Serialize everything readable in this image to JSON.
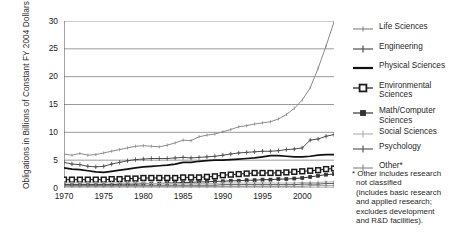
{
  "chart_data": {
    "type": "line",
    "title": "",
    "xlabel": "",
    "ylabel": "Obligations in Billions of Constant FY 2004 Dollars",
    "xlim": [
      1970,
      2004
    ],
    "ylim": [
      0,
      30
    ],
    "yticks": [
      0,
      5,
      10,
      15,
      20,
      25,
      30
    ],
    "xticks": [
      1970,
      1975,
      1980,
      1985,
      1990,
      1995,
      2000
    ],
    "xtick_labels": [
      "1970",
      "1975",
      "1980",
      "1985",
      "1990",
      "1995",
      "2000"
    ],
    "grid": "horizontal",
    "legend_position": "right",
    "x": [
      1970,
      1971,
      1972,
      1973,
      1974,
      1975,
      1976,
      1977,
      1978,
      1979,
      1980,
      1981,
      1982,
      1983,
      1984,
      1985,
      1986,
      1987,
      1988,
      1989,
      1990,
      1991,
      1992,
      1993,
      1994,
      1995,
      1996,
      1997,
      1998,
      1999,
      2000,
      2001,
      2002,
      2003,
      2004
    ],
    "series": [
      {
        "name": "Life Sciences",
        "color": "#8a8a8a",
        "marker": "tick",
        "values": [
          6.1,
          5.9,
          6.2,
          5.9,
          6.0,
          6.3,
          6.6,
          6.9,
          7.2,
          7.5,
          7.6,
          7.5,
          7.4,
          7.7,
          8.1,
          8.6,
          8.5,
          9.2,
          9.5,
          9.7,
          10.1,
          10.5,
          11.0,
          11.2,
          11.5,
          11.7,
          11.9,
          12.4,
          13.2,
          14.3,
          15.8,
          18.0,
          21.5,
          25.5,
          29.8
        ]
      },
      {
        "name": "Engineering",
        "color": "#4d4d4d",
        "marker": "plus",
        "values": [
          4.6,
          4.3,
          4.2,
          3.9,
          3.8,
          3.9,
          4.3,
          4.6,
          4.9,
          5.1,
          5.2,
          5.3,
          5.3,
          5.3,
          5.4,
          5.5,
          5.4,
          5.5,
          5.6,
          5.7,
          5.9,
          6.1,
          6.3,
          6.4,
          6.5,
          6.6,
          6.6,
          6.7,
          6.9,
          7.0,
          7.2,
          8.6,
          8.8,
          9.3,
          9.6
        ]
      },
      {
        "name": "Physical Sciences",
        "color": "#111111",
        "marker": "none",
        "values": [
          3.6,
          3.4,
          3.3,
          3.1,
          2.9,
          2.8,
          3.0,
          3.2,
          3.4,
          3.6,
          3.8,
          3.9,
          4.0,
          4.1,
          4.3,
          4.6,
          4.6,
          4.8,
          4.9,
          5.0,
          5.0,
          5.1,
          5.2,
          5.3,
          5.4,
          5.6,
          5.8,
          5.8,
          5.7,
          5.6,
          5.6,
          5.7,
          5.9,
          6.0,
          6.0
        ]
      },
      {
        "name": "Environmental Sciences",
        "color": "#1a1a1a",
        "marker": "square-large",
        "values": [
          1.5,
          1.5,
          1.5,
          1.5,
          1.5,
          1.5,
          1.6,
          1.6,
          1.7,
          1.7,
          1.8,
          1.8,
          1.8,
          1.8,
          1.8,
          1.9,
          1.9,
          1.9,
          2.0,
          2.1,
          2.3,
          2.4,
          2.5,
          2.6,
          2.7,
          2.7,
          2.7,
          2.7,
          2.8,
          2.9,
          3.0,
          3.1,
          3.2,
          3.4,
          3.5
        ]
      },
      {
        "name": "Math/Computer Sciences",
        "color": "#333333",
        "marker": "square-small",
        "values": [
          0.6,
          0.6,
          0.6,
          0.6,
          0.6,
          0.6,
          0.6,
          0.7,
          0.7,
          0.7,
          0.8,
          0.8,
          0.8,
          0.9,
          0.9,
          1.0,
          1.0,
          1.1,
          1.1,
          1.2,
          1.2,
          1.3,
          1.3,
          1.4,
          1.4,
          1.5,
          1.5,
          1.6,
          1.6,
          1.7,
          1.8,
          2.0,
          2.2,
          2.4,
          2.5
        ]
      },
      {
        "name": "Social Sciences",
        "color": "#b5b5b5",
        "marker": "plus",
        "values": [
          0.9,
          0.9,
          0.9,
          0.9,
          0.9,
          0.9,
          0.9,
          0.9,
          0.9,
          0.9,
          0.9,
          0.8,
          0.8,
          0.8,
          0.8,
          0.8,
          0.8,
          0.8,
          0.8,
          0.8,
          0.9,
          0.9,
          0.9,
          0.9,
          0.9,
          0.9,
          0.9,
          0.9,
          0.9,
          0.9,
          1.0,
          1.0,
          1.0,
          1.1,
          1.1
        ]
      },
      {
        "name": "Psychology",
        "color": "#5a5a5a",
        "marker": "plus",
        "values": [
          0.5,
          0.5,
          0.5,
          0.5,
          0.5,
          0.5,
          0.5,
          0.5,
          0.5,
          0.5,
          0.5,
          0.5,
          0.5,
          0.5,
          0.5,
          0.5,
          0.5,
          0.5,
          0.5,
          0.5,
          0.6,
          0.6,
          0.6,
          0.6,
          0.6,
          0.6,
          0.6,
          0.6,
          0.6,
          0.6,
          0.7,
          0.7,
          0.7,
          0.8,
          0.8
        ]
      },
      {
        "name": "Other*",
        "color": "#909090",
        "marker": "plus",
        "values": [
          0.3,
          0.3,
          0.3,
          0.3,
          0.3,
          0.3,
          0.3,
          0.3,
          0.3,
          0.3,
          0.3,
          0.3,
          0.3,
          0.3,
          0.3,
          0.3,
          0.3,
          0.3,
          0.3,
          0.3,
          0.3,
          0.3,
          0.3,
          0.3,
          0.3,
          0.3,
          0.3,
          0.3,
          0.3,
          0.3,
          0.3,
          0.4,
          0.4,
          0.4,
          0.4
        ]
      }
    ]
  },
  "legend": {
    "items": [
      {
        "label": "Life Sciences",
        "marker": "tick",
        "color": "#8a8a8a"
      },
      {
        "label": "Engineering",
        "marker": "plus",
        "color": "#4d4d4d"
      },
      {
        "label": "Physical Sciences",
        "marker": "none",
        "color": "#111111"
      },
      {
        "label": "Environmental Sciences",
        "marker": "square-large",
        "color": "#1a1a1a"
      },
      {
        "label": "Math/Computer Sciences",
        "marker": "square-small",
        "color": "#333333"
      },
      {
        "label": "Social Sciences",
        "marker": "plus",
        "color": "#b5b5b5"
      },
      {
        "label": "Psychology",
        "marker": "plus",
        "color": "#5a5a5a"
      },
      {
        "label": "Other*",
        "marker": "plus",
        "color": "#909090"
      }
    ]
  },
  "footnote": {
    "lines": [
      "* Other includes research",
      "not classified",
      "(includes basic research",
      "and applied research;",
      "excludes development",
      "and R&D facilities)."
    ]
  }
}
